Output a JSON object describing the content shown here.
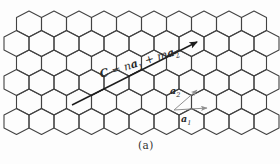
{
  "figure": {
    "caption": "(a)",
    "background": "#fdfdfd"
  },
  "formula": {
    "text": "C = na1 + ma2",
    "tokens": [
      {
        "t": "C",
        "style": "bold-italic"
      },
      {
        "t": " = ",
        "style": "normal"
      },
      {
        "t": "n",
        "style": "italic"
      },
      {
        "t": "a",
        "style": "bold-italic"
      },
      {
        "t": "1",
        "style": "sub"
      },
      {
        "t": " + ",
        "style": "normal"
      },
      {
        "t": "m",
        "style": "italic"
      },
      {
        "t": "a",
        "style": "bold-italic"
      },
      {
        "t": "2",
        "style": "sub"
      }
    ],
    "x": 101,
    "y": 78,
    "rotation_deg": -17,
    "font_size": 11,
    "sub_size": 7,
    "color": "#2a2a2a"
  },
  "chiral_arrow": {
    "x1": 72,
    "y1": 105,
    "x2": 197,
    "y2": 42,
    "color": "#1c1c1c",
    "width": 1.4
  },
  "basis_vectors": {
    "origin": {
      "x": 174,
      "y": 110
    },
    "color": "#8f8f8f",
    "width": 1,
    "a2": {
      "x2": 197,
      "y2": 90,
      "label": {
        "base": "a",
        "sub": "2",
        "x": 170,
        "y": 94
      }
    },
    "a1": {
      "x2": 207,
      "y2": 108,
      "label": {
        "base": "a",
        "sub": "1",
        "x": 181,
        "y": 122
      }
    },
    "label_size": 9.5,
    "label_sub_size": 6.5,
    "label_color": "#2a2a2a"
  },
  "lattice": {
    "hex_half_width": 12.5,
    "hex_vradius": 13,
    "hex_side_half": 6.5,
    "rows": 6,
    "row_pitch": 19.5,
    "top_cy": 24,
    "even_row": {
      "start_cx": 29,
      "count": 10
    },
    "odd_row": {
      "start_cx": 16.5,
      "count": 11
    },
    "stroke": "#434343",
    "stroke_width": 1.1
  }
}
